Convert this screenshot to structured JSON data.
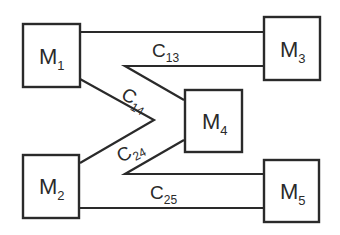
{
  "diagram": {
    "nodes": [
      {
        "id": "M1",
        "letter": "M",
        "sub": "1"
      },
      {
        "id": "M2",
        "letter": "M",
        "sub": "2"
      },
      {
        "id": "M3",
        "letter": "M",
        "sub": "3"
      },
      {
        "id": "M4",
        "letter": "M",
        "sub": "4"
      },
      {
        "id": "M5",
        "letter": "M",
        "sub": "5"
      }
    ],
    "edges": [
      {
        "from": "M1",
        "to": "M3",
        "letter": "C",
        "sub": "13"
      },
      {
        "from": "M1",
        "to": "M4",
        "letter": "C",
        "sub": "14"
      },
      {
        "from": "M2",
        "to": "M4",
        "letter": "C",
        "sub": "24"
      },
      {
        "from": "M2",
        "to": "M5",
        "letter": "C",
        "sub": "25"
      }
    ],
    "colors": {
      "stroke": "#2a2a2a",
      "background": "#ffffff"
    }
  }
}
